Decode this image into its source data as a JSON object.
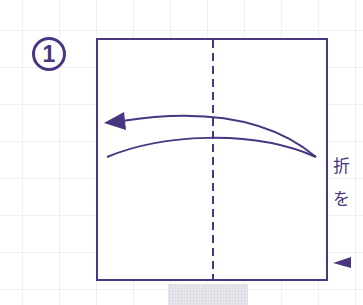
{
  "step": {
    "number": "1"
  },
  "diagram": {
    "type": "origami-fold-instruction",
    "fold_line": "vertical-dashed-center",
    "arrow_direction": "left",
    "line_color": "#4a3580"
  },
  "side_text": {
    "line1": "折",
    "line2": "を"
  },
  "colors": {
    "primary": "#4a3580",
    "grid": "#eeeef3",
    "shade": "#e4e4ea"
  }
}
